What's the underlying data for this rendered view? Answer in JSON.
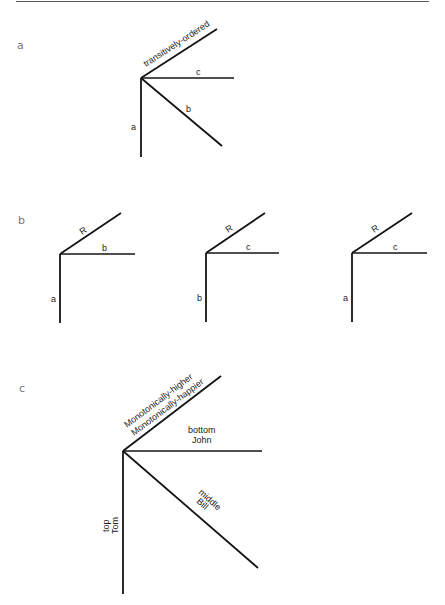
{
  "figure": {
    "panels": [
      {
        "id": "a",
        "label": "a",
        "edges": {
          "diagonal_up": "transitively-ordered",
          "horizontal": "c",
          "diagonal_down": "b",
          "vertical": "a"
        }
      },
      {
        "id": "b",
        "label": "b",
        "subfigures": [
          {
            "diagonal_up": "R",
            "horizontal": "b",
            "vertical": "a"
          },
          {
            "diagonal_up": "R",
            "horizontal": "c",
            "vertical": "b"
          },
          {
            "diagonal_up": "R",
            "horizontal": "c",
            "vertical": "a"
          }
        ]
      },
      {
        "id": "c",
        "label": "c",
        "edges": {
          "diagonal_up_line1": "Monotonically-higher",
          "diagonal_up_line2": "Monotonically-happier",
          "horizontal_line1": "bottom",
          "horizontal_line2": "John",
          "diagonal_down_line1": "middle",
          "diagonal_down_line2": "Bill",
          "vertical_line1": "top",
          "vertical_line2": "Tom"
        }
      }
    ]
  }
}
